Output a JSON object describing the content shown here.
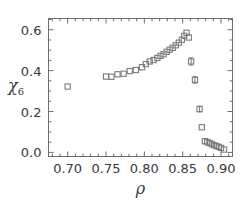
{
  "figure": {
    "background_color": "#ffffff",
    "frame_color": "#6e6e6e",
    "marker_color": "#7a7a7a",
    "text_color": "#3a3a3a"
  },
  "chart_data": {
    "type": "scatter",
    "title": "",
    "xlabel": "ρ",
    "ylabel": "χ",
    "ylabel_subscript": "6",
    "xlim": [
      0.675,
      0.915
    ],
    "ylim": [
      -0.02,
      0.655
    ],
    "xticks": [
      0.7,
      0.75,
      0.8,
      0.85,
      0.9
    ],
    "xticklabels": [
      "0.70",
      "0.75",
      "0.80",
      "0.85",
      "0.90"
    ],
    "yticks": [
      0.0,
      0.2,
      0.4,
      0.6
    ],
    "yticklabels": [
      "0.0",
      "0.2",
      "0.4",
      "0.6"
    ],
    "minor_ticks": true,
    "grid": false,
    "legend": null,
    "marker": "open-square",
    "series": [
      {
        "name": "chi_6",
        "x": [
          0.7,
          0.75,
          0.757,
          0.765,
          0.773,
          0.781,
          0.789,
          0.797,
          0.802,
          0.807,
          0.812,
          0.817,
          0.821,
          0.825,
          0.829,
          0.833,
          0.837,
          0.841,
          0.845,
          0.849,
          0.852,
          0.855,
          0.858,
          0.861,
          0.866,
          0.872,
          0.875,
          0.879,
          0.882,
          0.885,
          0.888,
          0.891,
          0.894,
          0.897,
          0.9,
          0.904
        ],
        "y": [
          0.322,
          0.371,
          0.37,
          0.382,
          0.385,
          0.398,
          0.403,
          0.417,
          0.432,
          0.445,
          0.452,
          0.462,
          0.472,
          0.48,
          0.492,
          0.502,
          0.512,
          0.524,
          0.537,
          0.551,
          0.57,
          0.585,
          0.562,
          0.445,
          0.355,
          0.212,
          0.123,
          0.055,
          0.05,
          0.046,
          0.04,
          0.035,
          0.031,
          0.027,
          0.022,
          0.014
        ],
        "yerr": [
          0,
          0,
          0,
          0,
          0,
          0,
          0,
          0,
          0,
          0,
          0,
          0,
          0,
          0,
          0,
          0,
          0,
          0,
          0,
          0,
          0,
          0,
          0,
          0.018,
          0.016,
          0.014,
          0,
          0,
          0,
          0,
          0,
          0,
          0,
          0,
          0,
          0
        ]
      }
    ]
  }
}
